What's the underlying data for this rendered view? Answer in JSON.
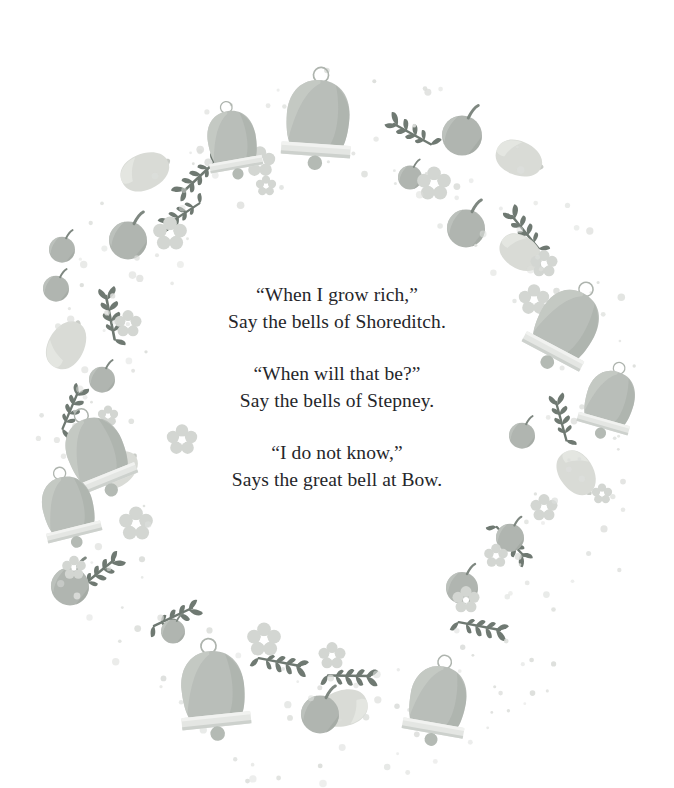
{
  "page": {
    "background_color": "#ffffff",
    "text_color": "#25262a"
  },
  "palette": {
    "bell_body": "#b9beb9",
    "bell_body_dark": "#a7ada8",
    "bell_band": "#e2e4e1",
    "bell_outline": "#a9b0aa",
    "leaf": "#6f7972",
    "berry": "#b0b5b0",
    "berry_dark": "#9ea49f",
    "lemon": "#d9dbd6",
    "flower": "#d3d6d2",
    "dot": "#dcdedb"
  },
  "verse": {
    "stanzas": [
      {
        "lines": [
          "“When I grow rich,”",
          "Say the bells of Shoreditch."
        ]
      },
      {
        "lines": [
          "“When will that be?”",
          "Say the bells of Stepney."
        ]
      },
      {
        "lines": [
          "“I do not know,”",
          "Says the great bell at Bow."
        ]
      }
    ]
  },
  "decorations": {
    "description": "Circular watercolour wreath of bells, leaf sprigs, berries, lemons, flowers and scattered dots",
    "bells": [
      {
        "x": 232,
        "y": 140,
        "scale": 0.86,
        "rotate": -10
      },
      {
        "x": 318,
        "y": 118,
        "scale": 1.12,
        "rotate": 4
      },
      {
        "x": 567,
        "y": 325,
        "scale": 1.05,
        "rotate": 28
      },
      {
        "x": 610,
        "y": 400,
        "scale": 0.86,
        "rotate": 16
      },
      {
        "x": 96,
        "y": 452,
        "scale": 1.02,
        "rotate": -22
      },
      {
        "x": 68,
        "y": 507,
        "scale": 0.9,
        "rotate": -14
      },
      {
        "x": 213,
        "y": 689,
        "scale": 1.12,
        "rotate": -6
      },
      {
        "x": 438,
        "y": 700,
        "scale": 1.0,
        "rotate": 10
      }
    ],
    "sprigs": [
      {
        "x": 183,
        "y": 192,
        "scale": 0.95,
        "rotate": -38
      },
      {
        "x": 168,
        "y": 224,
        "scale": 0.85,
        "rotate": -28
      },
      {
        "x": 394,
        "y": 124,
        "scale": 0.95,
        "rotate": 34
      },
      {
        "x": 512,
        "y": 216,
        "scale": 0.95,
        "rotate": 56
      },
      {
        "x": 106,
        "y": 296,
        "scale": 1.0,
        "rotate": 84
      },
      {
        "x": 78,
        "y": 392,
        "scale": 0.9,
        "rotate": 118
      },
      {
        "x": 556,
        "y": 402,
        "scale": 0.9,
        "rotate": 80
      },
      {
        "x": 114,
        "y": 560,
        "scale": 0.95,
        "rotate": 146
      },
      {
        "x": 192,
        "y": 608,
        "scale": 0.95,
        "rotate": 160
      },
      {
        "x": 300,
        "y": 666,
        "scale": 0.95,
        "rotate": 196
      },
      {
        "x": 370,
        "y": 676,
        "scale": 0.95,
        "rotate": 186
      },
      {
        "x": 500,
        "y": 630,
        "scale": 0.95,
        "rotate": 196
      },
      {
        "x": 524,
        "y": 556,
        "scale": 0.9,
        "rotate": 232
      }
    ],
    "berries": [
      {
        "x": 462,
        "y": 133,
        "r": 20
      },
      {
        "x": 410,
        "y": 176,
        "r": 12
      },
      {
        "x": 466,
        "y": 226,
        "r": 19
      },
      {
        "x": 128,
        "y": 238,
        "r": 19
      },
      {
        "x": 62,
        "y": 248,
        "r": 13
      },
      {
        "x": 56,
        "y": 287,
        "r": 13
      },
      {
        "x": 102,
        "y": 378,
        "r": 13
      },
      {
        "x": 522,
        "y": 434,
        "r": 13
      },
      {
        "x": 70,
        "y": 584,
        "r": 19
      },
      {
        "x": 173,
        "y": 630,
        "r": 12
      },
      {
        "x": 320,
        "y": 712,
        "r": 19
      },
      {
        "x": 462,
        "y": 586,
        "r": 16
      },
      {
        "x": 510,
        "y": 536,
        "r": 14
      }
    ],
    "lemons": [
      {
        "x": 144,
        "y": 172,
        "scale": 1.0,
        "rotate": -24
      },
      {
        "x": 518,
        "y": 158,
        "scale": 0.95,
        "rotate": 22
      },
      {
        "x": 520,
        "y": 252,
        "scale": 0.9,
        "rotate": 34
      },
      {
        "x": 66,
        "y": 346,
        "scale": 1.0,
        "rotate": -62
      },
      {
        "x": 576,
        "y": 472,
        "scale": 0.95,
        "rotate": 58
      },
      {
        "x": 344,
        "y": 708,
        "scale": 1.0,
        "rotate": 164
      },
      {
        "x": 118,
        "y": 470,
        "scale": 0.85,
        "rotate": -40
      }
    ],
    "flowers": [
      {
        "x": 260,
        "y": 162,
        "r": 9
      },
      {
        "x": 266,
        "y": 186,
        "r": 6
      },
      {
        "x": 170,
        "y": 234,
        "r": 10
      },
      {
        "x": 434,
        "y": 184,
        "r": 10
      },
      {
        "x": 544,
        "y": 264,
        "r": 8
      },
      {
        "x": 534,
        "y": 300,
        "r": 9
      },
      {
        "x": 128,
        "y": 324,
        "r": 8
      },
      {
        "x": 182,
        "y": 440,
        "r": 9
      },
      {
        "x": 136,
        "y": 524,
        "r": 10
      },
      {
        "x": 74,
        "y": 568,
        "r": 7
      },
      {
        "x": 264,
        "y": 640,
        "r": 10
      },
      {
        "x": 332,
        "y": 656,
        "r": 8
      },
      {
        "x": 496,
        "y": 556,
        "r": 7
      },
      {
        "x": 544,
        "y": 508,
        "r": 8
      },
      {
        "x": 466,
        "y": 600,
        "r": 8
      },
      {
        "x": 602,
        "y": 494,
        "r": 6
      },
      {
        "x": 108,
        "y": 416,
        "r": 6
      }
    ]
  }
}
